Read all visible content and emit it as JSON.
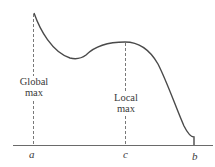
{
  "diagram": {
    "type": "function-extrema",
    "curve_color": "#4a4a4a",
    "axis_color": "#6a6a6a",
    "dashed_color": "#6a6a6a",
    "labels": {
      "global_max_line1": "Global",
      "global_max_line2": "max",
      "local_max_line1": "Local",
      "local_max_line2": "max"
    },
    "ticks": {
      "a": "a",
      "c": "c",
      "b": "b"
    }
  }
}
